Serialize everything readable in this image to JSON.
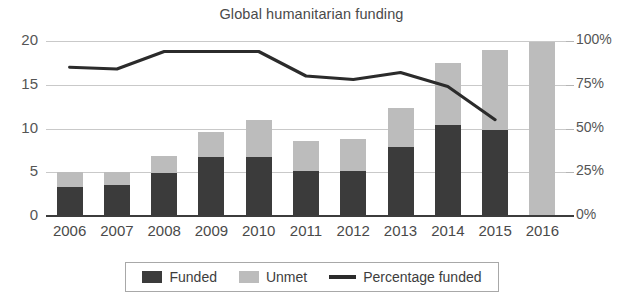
{
  "chart_data": {
    "type": "bar",
    "title": "Global humanitarian funding",
    "xlabel": "",
    "ylabel": "",
    "ylim": [
      0,
      20
    ],
    "y2lim": [
      0,
      100
    ],
    "grid": true,
    "legend_position": "bottom",
    "categories": [
      "2006",
      "2007",
      "2008",
      "2009",
      "2010",
      "2011",
      "2012",
      "2013",
      "2014",
      "2015",
      "2016"
    ],
    "y_ticks": [
      "0",
      "5",
      "10",
      "15",
      "20"
    ],
    "y2_ticks": [
      "0%",
      "25%",
      "50%",
      "75%",
      "100%"
    ],
    "series": [
      {
        "name": "Funded",
        "type": "bar",
        "color": "#3b3b3b",
        "values": [
          3.3,
          3.5,
          4.9,
          6.7,
          6.8,
          5.2,
          5.2,
          7.9,
          10.4,
          9.8,
          0
        ]
      },
      {
        "name": "Unmet",
        "type": "bar",
        "color": "#bcbcbc",
        "values": [
          1.7,
          1.5,
          2.0,
          2.9,
          4.2,
          3.4,
          3.6,
          4.5,
          7.1,
          9.2,
          19.9
        ]
      },
      {
        "name": "Percentage funded",
        "type": "line",
        "color": "#2b2b2b",
        "axis": "right",
        "values": [
          85,
          84,
          94,
          94,
          94,
          80,
          78,
          82,
          74,
          55,
          null
        ]
      }
    ],
    "totals": [
      5.0,
      5.0,
      6.9,
      9.6,
      11.0,
      8.6,
      8.8,
      12.4,
      17.5,
      19.0,
      19.9
    ]
  },
  "legend": {
    "items": [
      {
        "label": "Funded",
        "marker": "square-dark",
        "color": "#3b3b3b"
      },
      {
        "label": "Unmet",
        "marker": "square-gray",
        "color": "#bcbcbc"
      },
      {
        "label": "Percentage funded",
        "marker": "line",
        "color": "#2b2b2b"
      }
    ]
  },
  "footer": {
    "mark": ""
  }
}
